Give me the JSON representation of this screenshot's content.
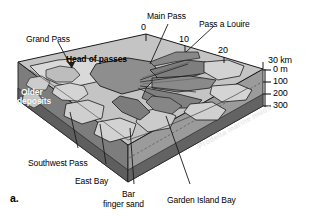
{
  "figure": {
    "panel_label": "a.",
    "type": "block-diagram",
    "colors": {
      "top_surface": "#c9c9c9",
      "land_light": "#d8d8d8",
      "water_mid": "#9a9a9a",
      "water_dark": "#6e6e6e",
      "front_face": "#8e8e8e",
      "front_face_dark": "#636363",
      "side_face": "#7a7a7a",
      "outline": "#1a1a1a",
      "background": "#ffffff"
    }
  },
  "labels": {
    "main_pass": "Main Pass",
    "pass_a_louire": "Pass a Louire",
    "grand_pass": "Grand Pass",
    "head_of_passes": "Head of passes",
    "older_deposits_line1": "Older",
    "older_deposits_line2": "deposits",
    "southwest_pass": "Southwest Pass",
    "east_bay": "East Bay",
    "bar_finger_sand_line1": "Bar",
    "bar_finger_sand_line2": "finger sand",
    "garden_island_bay": "Garden Island Bay",
    "prodelta_marine_muds": "Prodelta marine muds"
  },
  "scales": {
    "horizontal": {
      "unit": "km",
      "unit_label": "30 km",
      "ticks": [
        "0",
        "10",
        "20"
      ],
      "max": "30"
    },
    "vertical": {
      "unit": "m",
      "ticks": [
        {
          "label": "0 m",
          "value": 0
        },
        {
          "label": "100",
          "value": 100
        },
        {
          "label": "200",
          "value": 200
        },
        {
          "label": "300",
          "value": 300
        }
      ]
    }
  }
}
